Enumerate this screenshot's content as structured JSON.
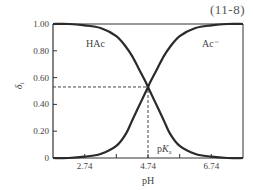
{
  "equation_label": "(11-8)",
  "chart_data": {
    "type": "line",
    "title": "",
    "xlabel": "pH",
    "ylabel": "δi",
    "xlim": [
      1.74,
      7.74
    ],
    "ylim": [
      0,
      1.0
    ],
    "grid": false,
    "x_ticks": [
      2.74,
      3.74,
      4.74,
      5.74,
      6.74
    ],
    "x_tick_labels": [
      "2.74",
      "",
      "4.74",
      "",
      "6.74"
    ],
    "y_ticks": [
      0,
      0.2,
      0.4,
      0.6,
      0.8,
      1.0
    ],
    "y_tick_labels": [
      "0",
      "0.20",
      "0.40",
      "0.60",
      "0.80",
      "1.00"
    ],
    "x": [
      1.74,
      2.24,
      2.74,
      3.24,
      3.74,
      4.04,
      4.24,
      4.44,
      4.64,
      4.74,
      4.84,
      5.04,
      5.24,
      5.44,
      5.74,
      6.24,
      6.74,
      7.24,
      7.74
    ],
    "series": [
      {
        "name": "HAc",
        "values": [
          1.0,
          1.0,
          0.99,
          0.97,
          0.91,
          0.83,
          0.76,
          0.67,
          0.58,
          0.53,
          0.48,
          0.38,
          0.28,
          0.18,
          0.09,
          0.03,
          0.01,
          0.0,
          0.0
        ]
      },
      {
        "name": "Ac⁻",
        "values": [
          0.0,
          0.0,
          0.01,
          0.03,
          0.09,
          0.18,
          0.28,
          0.38,
          0.48,
          0.53,
          0.58,
          0.67,
          0.76,
          0.83,
          0.91,
          0.97,
          0.99,
          1.0,
          1.0
        ]
      }
    ],
    "annotations": [
      {
        "text": "HAc",
        "x": 2.9,
        "y": 0.85
      },
      {
        "text": "Ac⁻",
        "x": 6.4,
        "y": 0.85
      },
      {
        "text": "pKa",
        "x": 4.95,
        "y": 0.06
      },
      {
        "type": "dashed-hline",
        "y": 0.53,
        "x_from": 1.74,
        "x_to": 4.74
      },
      {
        "type": "dashed-vline",
        "x": 4.74,
        "y_from": 0,
        "y_to": 0.53
      }
    ]
  },
  "labels": {
    "hac": "HAc",
    "ac": "Ac⁻",
    "pka_p": "p",
    "pka_k": "K",
    "pka_sub": "a",
    "xlabel": "pH",
    "ylabel_main": "δ",
    "ylabel_sub": "i"
  }
}
